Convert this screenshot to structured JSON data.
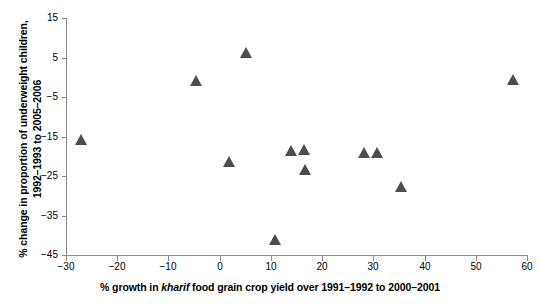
{
  "chart_data": {
    "type": "scatter",
    "title": "",
    "xlabel": "% growth in kharif food grain crop yield over 1991–1992 to 2000–2001",
    "xlabel_parts": {
      "before_italic": "% growth in ",
      "italic": "kharif",
      "after_italic": " food grain crop yield over 1991–1992 to 2000–2001"
    },
    "ylabel": "% change in proportion of underweight children, 1992–1993 to 2005–2006",
    "ylabel_line1": "% change in proportion of underweight children,",
    "ylabel_line2": "1992–1993 to 2005–2006",
    "xlim": [
      -30,
      60
    ],
    "ylim": [
      -45,
      15
    ],
    "xticks": [
      -30,
      -20,
      -10,
      0,
      10,
      20,
      30,
      40,
      50,
      60
    ],
    "xtick_labels": [
      "−30",
      "−20",
      "−10",
      "0",
      "10",
      "20",
      "30",
      "40",
      "50",
      "60"
    ],
    "yticks": [
      -45,
      -35,
      -25,
      -15,
      -5,
      5,
      15
    ],
    "ytick_labels": [
      "−45",
      "−35",
      "−25",
      "−15",
      "−5",
      "5",
      "15"
    ],
    "grid": false,
    "legend": null,
    "marker": "triangle",
    "marker_color": "#4d4d4d",
    "axis_color": "#8a8a8a",
    "points": [
      {
        "x": -27.0,
        "y": -15.8
      },
      {
        "x": -4.7,
        "y": -1.0
      },
      {
        "x": 1.8,
        "y": -21.5
      },
      {
        "x": 5.1,
        "y": 6.2
      },
      {
        "x": 10.9,
        "y": -41.3
      },
      {
        "x": 13.9,
        "y": -18.6
      },
      {
        "x": 16.4,
        "y": -18.3
      },
      {
        "x": 16.6,
        "y": -23.5
      },
      {
        "x": 28.1,
        "y": -19.2
      },
      {
        "x": 30.7,
        "y": -19.2
      },
      {
        "x": 35.4,
        "y": -27.8
      },
      {
        "x": 57.2,
        "y": -0.6
      }
    ]
  }
}
